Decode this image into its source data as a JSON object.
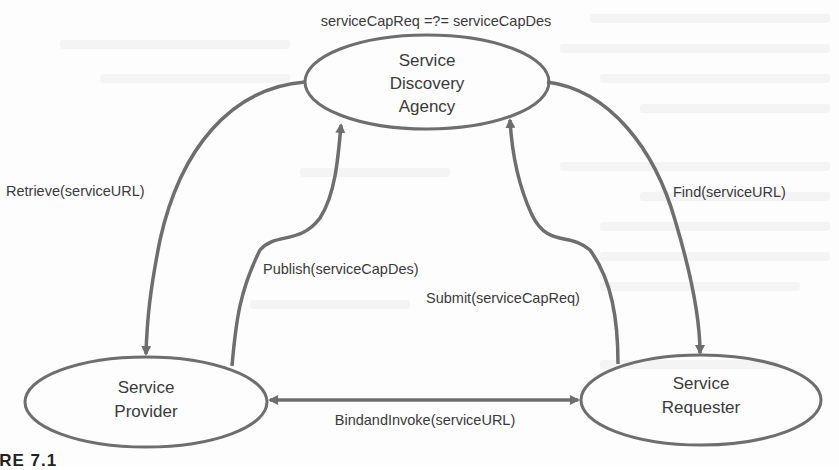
{
  "diagram": {
    "condition_label": "serviceCapReq =?= serviceCapDes",
    "nodes": {
      "agency": {
        "line1": "Service",
        "line2": "Discovery",
        "line3": "Agency"
      },
      "provider": {
        "line1": "Service",
        "line2": "Provider"
      },
      "requester": {
        "line1": "Service",
        "line2": "Requester"
      }
    },
    "edges": {
      "retrieve": "Retrieve(serviceURL)",
      "publish": "Publish(serviceCapDes)",
      "submit": "Submit(serviceCapReq)",
      "find": "Find(serviceURL)",
      "bind": "BindandInvoke(serviceURL)"
    },
    "colors": {
      "stroke": "#6e6e6e",
      "text": "#3a3a3a",
      "background": "#fdfdfd"
    }
  },
  "caption": "URE 7.1"
}
